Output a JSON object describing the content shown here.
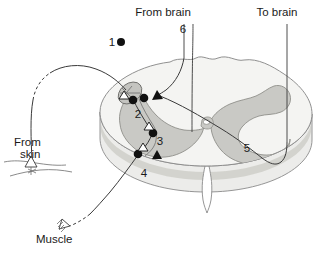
{
  "figure": {
    "background_color": "#ffffff"
  },
  "callouts": [
    {
      "id": "from-brain",
      "label": "From brain",
      "x": 163,
      "y": 16,
      "anchor": "middle"
    },
    {
      "id": "to-brain",
      "label": "To brain",
      "x": 277,
      "y": 16,
      "anchor": "middle"
    },
    {
      "id": "from-skin-1",
      "label": "From",
      "x": 14,
      "y": 146,
      "anchor": "start"
    },
    {
      "id": "from-skin-2",
      "label": "skin",
      "x": 20,
      "y": 158,
      "anchor": "start"
    },
    {
      "id": "muscle",
      "label": "Muscle",
      "x": 36,
      "y": 243,
      "anchor": "start"
    }
  ],
  "numbers": [
    {
      "id": "num-1",
      "label": "1",
      "x": 112,
      "y": 46,
      "desc": "afferent sensory axon from skin"
    },
    {
      "id": "num-2",
      "label": "2",
      "x": 138,
      "y": 118,
      "desc": "dorsal horn synapse region"
    },
    {
      "id": "num-3",
      "label": "3",
      "x": 160,
      "y": 145,
      "desc": "interneuron synapse"
    },
    {
      "id": "num-4",
      "label": "4",
      "x": 144,
      "y": 177,
      "desc": "efferent motor axon to muscle"
    },
    {
      "id": "num-5",
      "label": "5",
      "x": 247,
      "y": 152,
      "desc": "gray matter ventral horn"
    },
    {
      "id": "num-6",
      "label": "6",
      "x": 183,
      "y": 33,
      "desc": "descending tract from brain"
    }
  ],
  "colors": {
    "white_matter": "#f2f2f0",
    "white_matter_edge": "#8a8a8a",
    "gray_matter": "#c8c8c4",
    "gray_matter_edge": "#8f8f8a",
    "slab_side": "#e3e3e0",
    "slab_rim": "#cfcfc9",
    "nerve": "#3a3a3a",
    "label_text": "#1a1a1a",
    "synapse_fill": "#111111",
    "synapse_open": "#ffffff"
  },
  "synapses": {
    "filled_dots": [
      {
        "id": "dot-1-axon",
        "x": 121,
        "y": 42,
        "r": 4.0
      },
      {
        "id": "dot-2a",
        "x": 133,
        "y": 100,
        "r": 4.2
      },
      {
        "id": "dot-2b",
        "x": 143,
        "y": 98,
        "r": 4.2
      },
      {
        "id": "dot-3-upper",
        "x": 152,
        "y": 133,
        "r": 4.2
      },
      {
        "id": "dot-4-lower",
        "x": 138,
        "y": 154,
        "r": 4.2
      }
    ],
    "filled_triangles": [
      {
        "id": "tri-6-synapse",
        "x": 157,
        "y": 96,
        "size": 6.0,
        "rot": 125
      },
      {
        "id": "tri-3-lower",
        "x": 157,
        "y": 155,
        "size": 5.4,
        "rot": 0
      }
    ],
    "open_triangles": [
      {
        "id": "open-tri-2",
        "x": 124,
        "y": 96,
        "size": 5.0,
        "rot": 300
      },
      {
        "id": "open-tri-3",
        "x": 150,
        "y": 126,
        "size": 5.0,
        "rot": 20
      },
      {
        "id": "open-tri-4",
        "x": 143,
        "y": 147,
        "size": 5.0,
        "rot": 290
      }
    ]
  },
  "endings": {
    "skin_receptor": {
      "id": "skin-receptor-icon",
      "x": 30,
      "y": 163
    },
    "muscle_junction": {
      "id": "neuromuscular-junction-icon",
      "x": 67,
      "y": 224
    }
  }
}
